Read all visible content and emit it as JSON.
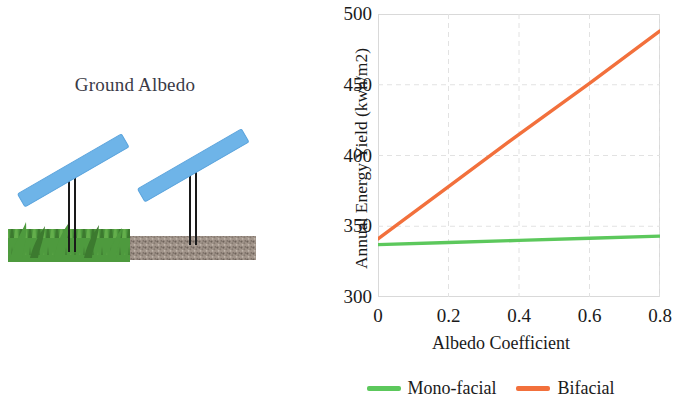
{
  "figure": {
    "illustration": {
      "title": "Ground Albedo",
      "panels": [
        {
          "name": "panel-left-over-grass",
          "surface": "grass"
        },
        {
          "name": "panel-right-over-gravel",
          "surface": "gravel"
        }
      ],
      "colors": {
        "panel": "#6EB4E8",
        "panel_edge": "#5AA3DC",
        "post": "#1a1a1a",
        "grass": "#4E9A3E",
        "grass_dark": "#3C7A2F",
        "gravel": "#9B8E85",
        "gravel_dark": "#6E635B"
      }
    }
  },
  "chart_data": {
    "type": "line",
    "title": "",
    "xlabel": "Albedo Coefficient",
    "ylabel": "Annual Energy Yield (kwh/m2)",
    "xlim": [
      0,
      0.8
    ],
    "ylim": [
      300,
      500
    ],
    "xticks": [
      0,
      0.2,
      0.4,
      0.6,
      0.8
    ],
    "xticklabels": [
      "0",
      "0.2",
      "0.4",
      "0.6",
      "0.8"
    ],
    "yticks": [
      300,
      350,
      400,
      450,
      500
    ],
    "yticklabels": [
      "300",
      "350",
      "400",
      "450",
      "500"
    ],
    "grid": true,
    "legend_position": "bottom",
    "x": [
      0,
      0.2,
      0.4,
      0.6,
      0.8
    ],
    "series": [
      {
        "name": "Mono-facial",
        "color": "#5CC85C",
        "values": [
          337,
          338.5,
          340,
          341.5,
          343
        ]
      },
      {
        "name": "Bifacial",
        "color": "#F2703C",
        "values": [
          341,
          378,
          415,
          451,
          488
        ]
      }
    ]
  }
}
